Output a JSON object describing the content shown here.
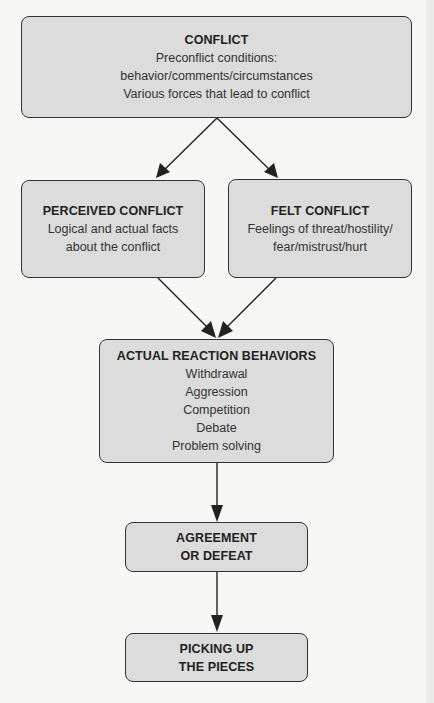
{
  "diagram": {
    "type": "flowchart",
    "colors": {
      "box_fill": "#dcdcdc",
      "box_border": "#333333",
      "background": "#f7f7f5",
      "arrow": "#222222"
    },
    "nodes": {
      "conflict": {
        "title": "CONFLICT",
        "lines": [
          "Preconflict conditions:",
          "behavior/comments/circumstances",
          "Various forces that lead to conflict"
        ]
      },
      "perceived": {
        "title": "PERCEIVED CONFLICT",
        "lines": [
          "Logical and actual facts",
          "about the conflict"
        ]
      },
      "felt": {
        "title": "FELT CONFLICT",
        "lines": [
          "Feelings of threat/hostility/",
          "fear/mistrust/hurt"
        ]
      },
      "actual": {
        "title": "ACTUAL REACTION BEHAVIORS",
        "lines": [
          "Withdrawal",
          "Aggression",
          "Competition",
          "Debate",
          "Problem solving"
        ]
      },
      "agreement": {
        "title_lines": [
          "AGREEMENT",
          "OR DEFEAT"
        ]
      },
      "picking": {
        "title_lines": [
          "PICKING UP",
          "THE PIECES"
        ]
      }
    },
    "edges": [
      {
        "from": "conflict",
        "to": "perceived"
      },
      {
        "from": "conflict",
        "to": "felt"
      },
      {
        "from": "perceived",
        "to": "actual"
      },
      {
        "from": "felt",
        "to": "actual"
      },
      {
        "from": "actual",
        "to": "agreement"
      },
      {
        "from": "agreement",
        "to": "picking"
      }
    ]
  }
}
